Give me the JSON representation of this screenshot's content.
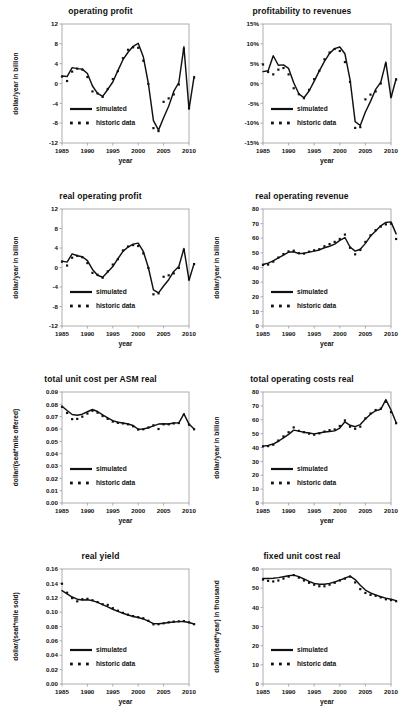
{
  "figure": {
    "legend": {
      "simulated": "simulated",
      "historic": "historic data"
    },
    "xlabel": "year",
    "xticks": [
      "1985",
      "1990",
      "1995",
      "2000",
      "2005",
      "2010"
    ]
  },
  "chart_data": [
    {
      "id": "operating-profit",
      "type": "line",
      "title": "operating profit",
      "xlabel": "year",
      "ylabel": "dollar/year  in billion",
      "xlim": [
        1985,
        2010
      ],
      "ylim": [
        -12,
        12
      ],
      "yticks": [
        "12",
        "8",
        "4",
        "0",
        "-4",
        "-8",
        "-12"
      ],
      "xticks": [
        "1985",
        "1990",
        "1995",
        "2000",
        "2005",
        "2010"
      ],
      "grid": false,
      "legend_position": "bottom-left",
      "x": [
        1985,
        1986,
        1987,
        1988,
        1989,
        1990,
        1991,
        1992,
        1993,
        1994,
        1995,
        1996,
        1997,
        1998,
        1999,
        2000,
        2001,
        2002,
        2003,
        2004,
        2005,
        2006,
        2007,
        2008,
        2009,
        2010
      ],
      "series": [
        {
          "name": "simulated",
          "style": "solid",
          "values": [
            1.5,
            1.4,
            3.2,
            3.0,
            2.9,
            2.0,
            -0.5,
            -2.0,
            -2.6,
            -1.2,
            0.3,
            2.6,
            4.8,
            6.3,
            7.5,
            8.1,
            5.4,
            0.0,
            -7.5,
            -9.4,
            -6.9,
            -4.6,
            -1.6,
            0.2,
            7.4,
            -5.2,
            1.4
          ]
        },
        {
          "name": "historic data",
          "style": "dotted",
          "values": [
            1.4,
            0.5,
            2.4,
            3.0,
            2.8,
            1.3,
            -1.6,
            -2.0,
            -2.7,
            -1.1,
            0.9,
            2.5,
            5.1,
            6.8,
            7.3,
            7.2,
            4.6,
            -0.1,
            -9.0,
            -9.6,
            -3.7,
            -3.0,
            -2.2,
            -0.2,
            6.9,
            -4.9,
            1.2
          ]
        }
      ]
    },
    {
      "id": "profitability-to-revenues",
      "type": "line",
      "title": "profitability to revenues",
      "xlabel": "year",
      "ylabel": "",
      "xlim": [
        1985,
        2010
      ],
      "ylim": [
        -15,
        15
      ],
      "yticks": [
        "15%",
        "10%",
        "5%",
        "0%",
        "-5%",
        "-10%",
        "-15%"
      ],
      "xticks": [
        "1985",
        "1990",
        "1995",
        "2000",
        "2005",
        "2010"
      ],
      "grid": false,
      "legend_position": "bottom-left",
      "x": [
        1985,
        1986,
        1987,
        1988,
        1989,
        1990,
        1991,
        1992,
        1993,
        1994,
        1995,
        1996,
        1997,
        1998,
        1999,
        2000,
        2001,
        2002,
        2003,
        2004,
        2005,
        2006,
        2007,
        2008,
        2009,
        2010
      ],
      "series": [
        {
          "name": "simulated",
          "style": "solid",
          "values": [
            3.0,
            3.2,
            7.0,
            4.6,
            4.7,
            3.8,
            0.2,
            -2.6,
            -3.6,
            -1.9,
            0.6,
            3.2,
            5.6,
            7.6,
            8.8,
            9.2,
            7.5,
            1.0,
            -9.6,
            -10.6,
            -7.2,
            -4.5,
            -1.5,
            0.3,
            5.4,
            -3.6,
            1.2
          ]
        },
        {
          "name": "historic data",
          "style": "dotted",
          "values": [
            4.8,
            2.9,
            2.3,
            3.5,
            3.9,
            2.3,
            -1.2,
            -2.7,
            -3.7,
            -1.6,
            1.1,
            3.2,
            6.1,
            7.8,
            8.7,
            8.2,
            5.4,
            0.4,
            -11.2,
            -11.0,
            -4.0,
            -2.8,
            -2.0,
            0.0,
            4.8,
            -3.2,
            1.0
          ]
        }
      ]
    },
    {
      "id": "real-operating-profit",
      "type": "line",
      "title": "real operating profit",
      "xlabel": "year",
      "ylabel": "dollar/year  in billion",
      "xlim": [
        1985,
        2010
      ],
      "ylim": [
        -12,
        12
      ],
      "yticks": [
        "12",
        "8",
        "4",
        "0",
        "-4",
        "-8",
        "-12"
      ],
      "xticks": [
        "1985",
        "1990",
        "1995",
        "2000",
        "2005",
        "2010"
      ],
      "grid": false,
      "legend_position": "bottom-left",
      "x": [
        1985,
        1986,
        1987,
        1988,
        1989,
        1990,
        1991,
        1992,
        1993,
        1994,
        1995,
        1996,
        1997,
        1998,
        1999,
        2000,
        2001,
        2002,
        2003,
        2004,
        2005,
        2006,
        2007,
        2008,
        2009,
        2010
      ],
      "series": [
        {
          "name": "simulated",
          "style": "solid",
          "values": [
            1.3,
            1.1,
            2.8,
            2.4,
            2.2,
            1.4,
            -0.4,
            -1.6,
            -2.0,
            -0.9,
            0.2,
            1.8,
            3.3,
            4.2,
            4.8,
            5.0,
            3.3,
            0.0,
            -4.6,
            -5.2,
            -3.8,
            -2.5,
            -0.8,
            0.2,
            3.9,
            -2.6,
            0.8
          ]
        },
        {
          "name": "historic data",
          "style": "dotted",
          "values": [
            1.2,
            0.4,
            2.0,
            2.4,
            2.1,
            0.9,
            -1.1,
            -1.5,
            -2.1,
            -0.8,
            0.6,
            1.7,
            3.5,
            4.3,
            4.6,
            4.4,
            2.9,
            -0.1,
            -5.5,
            -5.3,
            -1.9,
            -1.6,
            -1.2,
            -0.1,
            3.6,
            -2.4,
            0.7
          ]
        }
      ]
    },
    {
      "id": "real-operating-revenue",
      "type": "line",
      "title": "real operating revenue",
      "xlabel": "year",
      "ylabel": "dollar/year  in billion",
      "xlim": [
        1985,
        2010
      ],
      "ylim": [
        0,
        80
      ],
      "yticks": [
        "80",
        "70",
        "60",
        "50",
        "40",
        "30",
        "20",
        "10",
        "0"
      ],
      "xticks": [
        "1985",
        "1990",
        "1995",
        "2000",
        "2005",
        "2010"
      ],
      "grid": false,
      "legend_position": "bottom-left",
      "x": [
        1985,
        1986,
        1987,
        1988,
        1989,
        1990,
        1991,
        1992,
        1993,
        1994,
        1995,
        1996,
        1997,
        1998,
        1999,
        2000,
        2001,
        2002,
        2003,
        2004,
        2005,
        2006,
        2007,
        2008,
        2009,
        2010
      ],
      "series": [
        {
          "name": "simulated",
          "style": "solid",
          "values": [
            42.0,
            43.0,
            44.5,
            46.5,
            48.5,
            50.5,
            50.8,
            49.5,
            49.8,
            50.5,
            51.2,
            52.0,
            53.5,
            54.5,
            56.0,
            58.5,
            60.5,
            54.0,
            51.2,
            52.5,
            56.5,
            61.5,
            65.0,
            68.5,
            70.8,
            71.2,
            63.0
          ]
        },
        {
          "name": "historic data",
          "style": "dotted",
          "values": [
            41.8,
            42.0,
            44.0,
            46.8,
            49.2,
            51.0,
            51.5,
            49.8,
            49.5,
            50.8,
            51.8,
            52.5,
            54.5,
            56.0,
            57.5,
            59.5,
            62.5,
            53.5,
            49.0,
            52.0,
            57.5,
            62.0,
            65.5,
            68.0,
            69.5,
            70.0,
            59.5
          ]
        }
      ]
    },
    {
      "id": "total-unit-cost-per-asm-real",
      "type": "line",
      "title": "total unit cost per ASM real",
      "xlabel": "year",
      "ylabel": "dollar/(seat*mile offered)",
      "xlim": [
        1985,
        2010
      ],
      "ylim": [
        0.0,
        0.09
      ],
      "yticks": [
        "0.09",
        "0.08",
        "0.07",
        "0.06",
        "0.05",
        "0.04",
        "0.03",
        "0.02",
        "0.01",
        "0.00"
      ],
      "xticks": [
        "1985",
        "1990",
        "1995",
        "2000",
        "2005",
        "2010"
      ],
      "grid": false,
      "legend_position": "bottom-left",
      "x": [
        1985,
        1986,
        1987,
        1988,
        1989,
        1990,
        1991,
        1992,
        1993,
        1994,
        1995,
        1996,
        1997,
        1998,
        1999,
        2000,
        2001,
        2002,
        2003,
        2004,
        2005,
        2006,
        2007,
        2008,
        2009,
        2010
      ],
      "series": [
        {
          "name": "simulated",
          "style": "solid",
          "values": [
            0.0785,
            0.075,
            0.0718,
            0.0712,
            0.072,
            0.074,
            0.0758,
            0.0742,
            0.0715,
            0.069,
            0.0668,
            0.0655,
            0.0648,
            0.064,
            0.0628,
            0.0598,
            0.06,
            0.061,
            0.0625,
            0.064,
            0.0643,
            0.064,
            0.0648,
            0.065,
            0.0722,
            0.064,
            0.06
          ]
        },
        {
          "name": "historic data",
          "style": "dotted",
          "values": [
            0.078,
            0.073,
            0.068,
            0.0682,
            0.07,
            0.0725,
            0.0748,
            0.0732,
            0.0705,
            0.0682,
            0.066,
            0.065,
            0.0645,
            0.0638,
            0.0622,
            0.0595,
            0.0598,
            0.0612,
            0.063,
            0.06,
            0.0638,
            0.0638,
            0.0645,
            0.0648,
            0.0718,
            0.0635,
            0.0598
          ]
        }
      ]
    },
    {
      "id": "total-operating-costs-real",
      "type": "line",
      "title": "total operating costs real",
      "xlabel": "year",
      "ylabel": "dollar/year  in billion",
      "xlim": [
        1985,
        2010
      ],
      "ylim": [
        0,
        80
      ],
      "yticks": [
        "80",
        "70",
        "60",
        "50",
        "40",
        "30",
        "20",
        "10",
        "0"
      ],
      "xticks": [
        "1985",
        "1990",
        "1995",
        "2000",
        "2005",
        "2010"
      ],
      "grid": false,
      "legend_position": "bottom-left",
      "x": [
        1985,
        1986,
        1987,
        1988,
        1989,
        1990,
        1991,
        1992,
        1993,
        1994,
        1995,
        1996,
        1997,
        1998,
        1999,
        2000,
        2001,
        2002,
        2003,
        2004,
        2005,
        2006,
        2007,
        2008,
        2009,
        2010
      ],
      "series": [
        {
          "name": "simulated",
          "style": "solid",
          "values": [
            41.0,
            41.5,
            42.5,
            44.5,
            47.0,
            49.5,
            52.5,
            51.8,
            51.0,
            50.5,
            49.8,
            50.5,
            51.2,
            51.5,
            52.0,
            54.0,
            58.5,
            56.0,
            55.0,
            56.5,
            60.5,
            64.0,
            66.5,
            67.5,
            74.5,
            67.0,
            58.0
          ]
        },
        {
          "name": "historic data",
          "style": "dotted",
          "values": [
            40.8,
            41.0,
            42.0,
            45.0,
            48.0,
            51.0,
            54.5,
            52.0,
            51.0,
            50.0,
            49.2,
            50.2,
            51.5,
            52.5,
            53.0,
            55.5,
            59.5,
            55.0,
            53.5,
            55.0,
            61.0,
            64.5,
            67.0,
            68.0,
            73.0,
            65.5,
            57.5
          ]
        }
      ]
    },
    {
      "id": "real-yield",
      "type": "line",
      "title": "real yield",
      "xlabel": "year",
      "ylabel": "dollar/(seat*mile sold)",
      "xlim": [
        1985,
        2010
      ],
      "ylim": [
        0.0,
        0.16
      ],
      "yticks": [
        "0.16",
        "0.14",
        "0.12",
        "0.10",
        "0.08",
        "0.06",
        "0.04",
        "0.02",
        "0.00"
      ],
      "xticks": [
        "1985",
        "1990",
        "1995",
        "2000",
        "2005",
        "2010"
      ],
      "grid": false,
      "legend_position": "bottom-left",
      "x": [
        1985,
        1986,
        1987,
        1988,
        1989,
        1990,
        1991,
        1992,
        1993,
        1994,
        1995,
        1996,
        1997,
        1998,
        1999,
        2000,
        2001,
        2002,
        2003,
        2004,
        2005,
        2006,
        2007,
        2008,
        2009,
        2010
      ],
      "series": [
        {
          "name": "simulated",
          "style": "solid",
          "values": [
            0.13,
            0.1255,
            0.121,
            0.118,
            0.1168,
            0.1172,
            0.116,
            0.1135,
            0.1105,
            0.1072,
            0.104,
            0.101,
            0.0985,
            0.096,
            0.094,
            0.0925,
            0.0905,
            0.0875,
            0.084,
            0.0838,
            0.0845,
            0.0855,
            0.0862,
            0.0868,
            0.087,
            0.0855,
            0.0835
          ]
        },
        {
          "name": "historic data",
          "style": "dotted",
          "values": [
            0.1395,
            0.127,
            0.1195,
            0.115,
            0.118,
            0.1185,
            0.1165,
            0.114,
            0.111,
            0.11,
            0.1055,
            0.102,
            0.099,
            0.0965,
            0.0945,
            0.093,
            0.0915,
            0.088,
            0.083,
            0.0832,
            0.0845,
            0.0858,
            0.0868,
            0.0872,
            0.0875,
            0.0858,
            0.0832
          ]
        }
      ]
    },
    {
      "id": "fixed-unit-cost-real",
      "type": "line",
      "title": "fixed unit cost real",
      "xlabel": "year",
      "ylabel": "dollar/(seat*year)  in thousand",
      "xlim": [
        1985,
        2010
      ],
      "ylim": [
        0,
        60
      ],
      "yticks": [
        "60",
        "50",
        "40",
        "30",
        "20",
        "10",
        "0"
      ],
      "xticks": [
        "1985",
        "1990",
        "1995",
        "2000",
        "2005",
        "2010"
      ],
      "grid": false,
      "legend_position": "bottom-left",
      "x": [
        1985,
        1986,
        1987,
        1988,
        1989,
        1990,
        1991,
        1992,
        1993,
        1994,
        1995,
        1996,
        1997,
        1998,
        1999,
        2000,
        2001,
        2002,
        2003,
        2004,
        2005,
        2006,
        2007,
        2008,
        2009,
        2010
      ],
      "series": [
        {
          "name": "simulated",
          "style": "solid",
          "values": [
            55.0,
            55.0,
            55.2,
            55.5,
            56.0,
            56.5,
            56.8,
            56.0,
            54.8,
            53.5,
            52.5,
            52.0,
            52.0,
            52.5,
            53.2,
            54.2,
            55.2,
            56.3,
            54.5,
            51.5,
            49.0,
            47.5,
            46.5,
            45.5,
            44.8,
            44.2,
            43.5
          ]
        },
        {
          "name": "historic data",
          "style": "dotted",
          "values": [
            54.5,
            53.8,
            53.5,
            54.0,
            55.0,
            56.0,
            56.8,
            55.5,
            54.0,
            52.8,
            51.8,
            51.0,
            51.0,
            51.8,
            52.8,
            54.0,
            55.0,
            56.0,
            53.0,
            49.5,
            47.5,
            46.5,
            46.0,
            45.2,
            44.2,
            43.8,
            43.2
          ]
        }
      ]
    }
  ]
}
